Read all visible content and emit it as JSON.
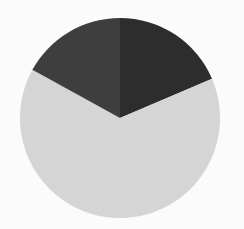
{
  "chart_data": {
    "type": "pie",
    "title": "",
    "labels": [
      "Slice A",
      "Slice B",
      "Slice C"
    ],
    "values": [
      18.6,
      64.4,
      17.0
    ],
    "colors": [
      "#2d2d2d",
      "#d5d5d5",
      "#3e3e3e"
    ],
    "start_angle_deg": 0,
    "direction": "clockwise",
    "legend": false,
    "data_labels": false
  },
  "layout": {
    "center": [
      120,
      118
    ],
    "radius": 100,
    "background": "#fbfbfb"
  }
}
